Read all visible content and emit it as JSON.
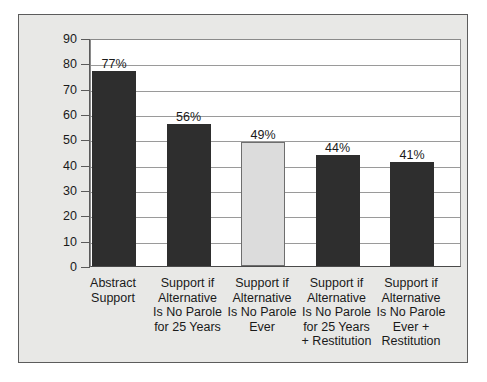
{
  "figure": {
    "background_color": "#ffffff",
    "panel_color": "#e8e8e6",
    "panel_border_color": "#5c5c5c",
    "plot_background_color": "#ffffff",
    "gridline_color": "#9a9a9a"
  },
  "chart_data": {
    "type": "bar",
    "title": "",
    "subtitle": "",
    "xlabel": "",
    "ylabel": "",
    "ylim": [
      0,
      90
    ],
    "ytick_labels": [
      "90",
      "80",
      "70",
      "60",
      "50",
      "40",
      "30",
      "20",
      "10",
      "0"
    ],
    "ytick_values": [
      90,
      80,
      70,
      60,
      50,
      40,
      30,
      20,
      10,
      0
    ],
    "grid": true,
    "grid_axis": "y",
    "legend": false,
    "legend_position": "none",
    "categories": [
      "Abstract Support",
      "Support if Alternative Is No Parole for 25 Years",
      "Support if Alternative Is No Parole Ever",
      "Support if Alternative Is No Parole for 25 Years + Restitution",
      "Support if Alternative Is No Parole Ever + Restitution"
    ],
    "category_label_lines": [
      [
        "Abstract",
        "Support"
      ],
      [
        "Support if",
        "Alternative",
        "Is No Parole",
        "for 25 Years"
      ],
      [
        "Support if",
        "Alternative",
        "Is No Parole",
        "Ever"
      ],
      [
        "Support if",
        "Alternative",
        "Is No Parole",
        "for 25 Years",
        "+ Restitution"
      ],
      [
        "Support if",
        "Alternative",
        "Is No Parole",
        "Ever +",
        "Restitution"
      ]
    ],
    "values": [
      77,
      56,
      49,
      44,
      41
    ],
    "data_labels": [
      "77%",
      "56%",
      "49%",
      "44%",
      "41%"
    ],
    "bar_colors": [
      "#2e2e2e",
      "#2e2e2e",
      "#dcdcdc",
      "#2e2e2e",
      "#2e2e2e"
    ],
    "bar_styles": [
      "dark",
      "dark",
      "light",
      "dark",
      "dark"
    ],
    "highlighted_index": 2
  }
}
